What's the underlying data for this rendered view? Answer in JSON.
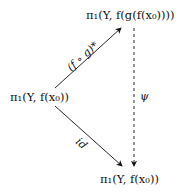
{
  "diagram": {
    "type": "commutative-diagram",
    "nodes": {
      "top": "π₁(Y, f(g(f(x₀))))",
      "left": "π₁(Y, f(x₀))",
      "bottom": "π₁(Y, f(x₀))"
    },
    "arrows": {
      "upper": {
        "from": "left",
        "to": "top",
        "label": "(f ∘ g)*",
        "style": "solid"
      },
      "lower": {
        "from": "left",
        "to": "bottom",
        "label": "id",
        "style": "solid"
      },
      "vertical": {
        "from": "top",
        "to": "bottom",
        "label": "ψ",
        "style": "dashed"
      }
    }
  }
}
